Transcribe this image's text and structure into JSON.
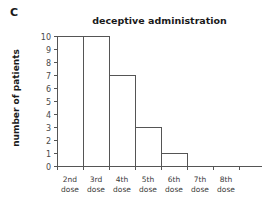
{
  "panel": {
    "label": "C"
  },
  "chart_data": {
    "type": "bar",
    "title": "deceptive administration",
    "xlabel": "",
    "ylabel": "number of patients",
    "categories": [
      "2nd dose",
      "3rd dose",
      "4th dose",
      "5th dose",
      "6th dose",
      "7th dose",
      "8th dose"
    ],
    "category_lines": [
      {
        "line1": "2nd",
        "line2": "dose"
      },
      {
        "line1": "3rd",
        "line2": "dose"
      },
      {
        "line1": "4th",
        "line2": "dose"
      },
      {
        "line1": "5th",
        "line2": "dose"
      },
      {
        "line1": "6th",
        "line2": "dose"
      },
      {
        "line1": "7th",
        "line2": "dose"
      },
      {
        "line1": "8th",
        "line2": "dose"
      }
    ],
    "values": [
      10,
      10,
      7,
      3,
      1,
      0,
      0
    ],
    "ylim": [
      0,
      10
    ],
    "ytick_labels": [
      "0",
      "1",
      "2",
      "3",
      "4",
      "5",
      "6",
      "7",
      "8",
      "9",
      "10"
    ],
    "ytick_values": [
      0,
      1,
      2,
      3,
      4,
      5,
      6,
      7,
      8,
      9,
      10
    ],
    "grid": false,
    "legend": false,
    "bar_fill": "#ffffff",
    "bar_stroke": "#555555",
    "axis_color": "#555555",
    "text_color": "#1a1a1a"
  }
}
